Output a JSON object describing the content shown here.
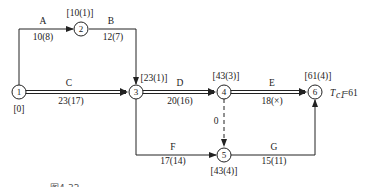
{
  "nodes": [
    {
      "id": "1",
      "label": "1",
      "x": 19,
      "y": 92,
      "time_label": "[0]"
    },
    {
      "id": "2",
      "label": "2",
      "x": 81,
      "y": 29,
      "time_label": "[10(1)]"
    },
    {
      "id": "3",
      "label": "3",
      "x": 136,
      "y": 92,
      "time_label": "[23(1)]"
    },
    {
      "id": "4",
      "label": "4",
      "x": 224,
      "y": 92,
      "time_label": "[43(3)]"
    },
    {
      "id": "5",
      "label": "5",
      "x": 224,
      "y": 155,
      "time_label": "[43(4)]"
    },
    {
      "id": "6",
      "label": "6",
      "x": 315,
      "y": 92,
      "time_label": "[61(4)]"
    }
  ],
  "activities": [
    {
      "name": "A",
      "from": "1",
      "to": "2",
      "duration": "10(8)",
      "critical": false
    },
    {
      "name": "B",
      "from": "2",
      "to": "3",
      "duration": "12(7)",
      "critical": false
    },
    {
      "name": "C",
      "from": "1",
      "to": "3",
      "duration": "23(17)",
      "critical": true
    },
    {
      "name": "D",
      "from": "3",
      "to": "4",
      "duration": "20(16)",
      "critical": true
    },
    {
      "name": "E",
      "from": "4",
      "to": "6",
      "duration": "18(×)",
      "critical": true
    },
    {
      "name": "F",
      "from": "3",
      "to": "5",
      "duration": "17(14)",
      "critical": false
    },
    {
      "name": "G",
      "from": "5",
      "to": "6",
      "duration": "15(11)",
      "critical": false
    },
    {
      "name": "dummy",
      "from": "4",
      "to": "5",
      "duration": "0",
      "critical": false,
      "dashed": true
    }
  ],
  "labels": {
    "n1_time": "[0]",
    "n2_time": "[10(1)]",
    "n3_time": "[23(1)]",
    "n4_time": "[43(3)]",
    "n5_time": "[43(4)]",
    "n6_time": "[61(4)]",
    "A": "A",
    "A_dur": "10(8)",
    "B": "B",
    "B_dur": "12(7)",
    "C": "C",
    "C_dur": "23(17)",
    "D": "D",
    "D_dur": "20(16)",
    "E": "E",
    "E_dur": "18(×)",
    "F": "F",
    "F_dur": "17(14)",
    "G": "G",
    "G_dur": "15(11)",
    "dummy_dur": "0",
    "tc_symbol": "T",
    "tc_sub": "c1",
    "tc_value": "=61",
    "node1": "1",
    "node2": "2",
    "node3": "3",
    "node4": "4",
    "node5": "5",
    "node6": "6"
  },
  "caption": "图4-32 ……",
  "colors": {
    "line": "#222222",
    "background": "#ffffff"
  }
}
